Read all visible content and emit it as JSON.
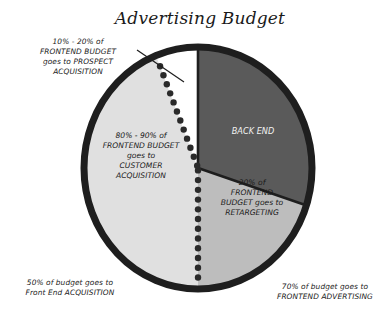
{
  "chart_data": {
    "type": "pie",
    "title": "Advertising Budget",
    "start_angle_deg": 0,
    "direction": "clockwise",
    "slices": [
      {
        "name": "back-end",
        "label": "BACK END",
        "value": 30,
        "color": "#5a5a5a",
        "label_lines": [
          "BACK END"
        ],
        "label_color": "#f2f2f2"
      },
      {
        "name": "retargeting",
        "label": "20% of FRONTEND BUDGET goes to RETARGETING",
        "value": 20,
        "color": "#bdbdbd",
        "label_lines": [
          "20% of",
          "FRONTEND",
          "BUDGET goes to",
          "RETARGETING"
        ],
        "label_color": "#1a1a1a"
      },
      {
        "name": "customer-acquisition",
        "label": "80% - 90% of FRONTEND BUDGET goes to CUSTOMER ACQUISITION",
        "value": 44,
        "color": "#e0e0e0",
        "label_lines": [
          "80% - 90% of",
          "FRONTEND BUDGET",
          "goes to",
          "CUSTOMER",
          "ACQUISITION"
        ],
        "label_color": "#1a1a1a"
      },
      {
        "name": "prospect-acquisition",
        "label": "10% - 20% of FRONTEND BUDGET goes to PROSPECT ACQUISITION",
        "value": 6,
        "color": "#ffffff",
        "label_lines": [
          "10% - 20% of",
          "FRONTEND BUDGET",
          "goes to PROSPECT",
          "ACQUISITION"
        ],
        "label_color": "#1a1a1a",
        "label_outside": true
      }
    ],
    "dotted_divider": {
      "description": "Dotted line separating frontend (left) from the rest of budget",
      "between": [
        "retargeting",
        "customer-acquisition"
      ],
      "extends_to_boundary_of": "prospect-acquisition"
    },
    "annotations": [
      {
        "name": "frontend-acquisition-note",
        "lines": [
          "50% of budget goes to",
          "Front End ACQUISITION"
        ],
        "position": "bottom-left"
      },
      {
        "name": "frontend-advertising-note",
        "lines": [
          "70% of budget goes to",
          "FRONTEND ADVERTISING"
        ],
        "position": "bottom-right"
      }
    ],
    "legend": null,
    "colors": {
      "outline": "#1e1e1e",
      "dots": "#2a2a2a",
      "background": "#ffffff"
    }
  }
}
